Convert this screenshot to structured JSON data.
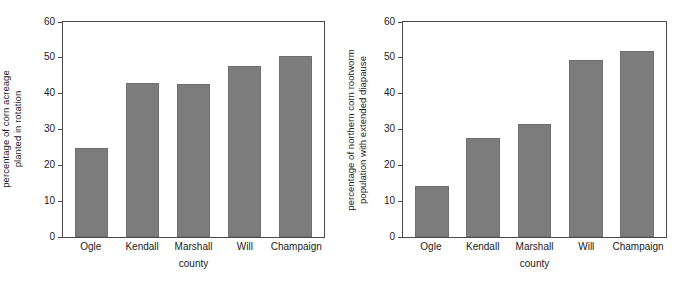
{
  "figure": {
    "background": "#ffffff",
    "bar_color": "#7c7c7c",
    "axis_color": "#4a4a4a",
    "text_color": "#1a1a1a"
  },
  "chart_data": [
    {
      "type": "bar",
      "panel": "left",
      "title": "",
      "xlabel": "county",
      "ylabel": "percentage of corn acreage\nplanted in rotation",
      "categories": [
        "Ogle",
        "Kendall",
        "Marshall",
        "Will",
        "Champaign"
      ],
      "values": [
        24.9,
        43.1,
        42.8,
        47.8,
        50.4
      ],
      "ylim": [
        0,
        60
      ],
      "yticks": [
        0,
        10,
        20,
        30,
        40,
        50,
        60
      ],
      "ytick_labels": [
        "0",
        "10",
        "20",
        "30",
        "40",
        "50",
        "60"
      ],
      "grid": false,
      "legend": false
    },
    {
      "type": "bar",
      "panel": "right",
      "title": "",
      "xlabel": "county",
      "ylabel": "percentage of northern corn rootworm\npopulation with extended diapause",
      "categories": [
        "Ogle",
        "Kendall",
        "Marshall",
        "Will",
        "Champaign"
      ],
      "values": [
        14.2,
        27.6,
        31.6,
        49.4,
        51.8
      ],
      "ylim": [
        0,
        60
      ],
      "yticks": [
        0,
        10,
        20,
        30,
        40,
        50,
        60
      ],
      "ytick_labels": [
        "0",
        "10",
        "20",
        "30",
        "40",
        "50",
        "60"
      ],
      "grid": false,
      "legend": false
    }
  ]
}
